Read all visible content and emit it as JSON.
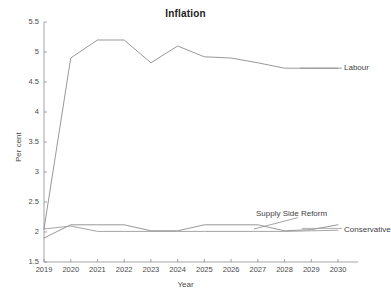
{
  "chart_data": {
    "type": "line",
    "title": "Inflation",
    "xlabel": "Year",
    "ylabel": "Per cent",
    "x": [
      2019,
      2020,
      2021,
      2022,
      2023,
      2024,
      2025,
      2026,
      2027,
      2028,
      2029,
      2030
    ],
    "xtick_labels": [
      "2019",
      "2020",
      "2021",
      "2022",
      "2023",
      "2024",
      "2025",
      "2026",
      "2027",
      "2028",
      "2029",
      "2030"
    ],
    "ytick_labels": [
      "5.5",
      "5",
      "4.5",
      "4",
      "3.5",
      "3",
      "2.5",
      "2",
      "1.5"
    ],
    "ytick_values": [
      5.5,
      5,
      4.5,
      4,
      3.5,
      3,
      2.5,
      2,
      1.5
    ],
    "xlim": [
      2019,
      2030
    ],
    "ylim": [
      1.5,
      5.5
    ],
    "grid": false,
    "legend_position": "inline-right",
    "series": [
      {
        "name": "Labour",
        "color": "#8c8c8c",
        "values": [
          2.05,
          4.9,
          5.2,
          5.2,
          4.82,
          5.1,
          4.92,
          4.9,
          4.82,
          4.73,
          4.73,
          4.73
        ]
      },
      {
        "name": "Supply Side Reform",
        "color": "#8c8c8c",
        "values": [
          1.9,
          2.12,
          2.12,
          2.12,
          2.02,
          2.02,
          2.12,
          2.12,
          2.12,
          2.02,
          2.04,
          2.12
        ]
      },
      {
        "name": "Conservative",
        "color": "#9a9a9a",
        "values": [
          2.05,
          2.1,
          2.01,
          2.01,
          2.01,
          2.01,
          2.01,
          2.01,
          2.01,
          2.01,
          2.02,
          2.03
        ]
      }
    ],
    "annotations": [
      {
        "text": "Labour",
        "x": 2030,
        "y": 4.73
      },
      {
        "text": "Supply Side Reform",
        "x": 2030,
        "y": 2.3
      },
      {
        "text": "Conservative",
        "x": 2030,
        "y": 2.03
      }
    ]
  },
  "axis_colors": {
    "axis": "#8d8d8d",
    "text": "#4a4a4a",
    "title": "#222222",
    "background": "#ffffff"
  }
}
